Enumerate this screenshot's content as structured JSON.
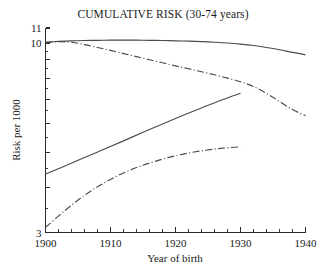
{
  "chart_data": {
    "type": "line",
    "title": "CUMULATIVE RISK (30-74 years)",
    "xlabel": "Year of birth",
    "ylabel": "Risk per 1000",
    "xlim": [
      1900,
      1940
    ],
    "ylim": [
      3,
      11
    ],
    "yscale": "log",
    "grid": false,
    "legend": "none",
    "xticks": [
      1900,
      1910,
      1920,
      1930,
      1940
    ],
    "xtick_labels": [
      "1900",
      "1910",
      "1920",
      "1930",
      "1940"
    ],
    "xminor_tick_step": 2,
    "yticks": [
      3,
      4,
      5,
      6,
      7,
      8,
      9,
      10,
      11
    ],
    "ytick_labels": [
      "3",
      "",
      "",
      "",
      "",
      "",
      "",
      "10",
      "11"
    ],
    "series": [
      {
        "name": "upper-solid",
        "style": "solid",
        "x": [
          1900,
          1902,
          1904,
          1906,
          1908,
          1910,
          1912,
          1914,
          1916,
          1918,
          1920,
          1922,
          1924,
          1926,
          1928,
          1930,
          1932,
          1934,
          1936,
          1938,
          1940
        ],
        "values": [
          10.05,
          10.1,
          10.14,
          10.16,
          10.17,
          10.18,
          10.18,
          10.18,
          10.17,
          10.16,
          10.14,
          10.12,
          10.09,
          10.05,
          10.0,
          9.93,
          9.84,
          9.72,
          9.58,
          9.42,
          9.28
        ]
      },
      {
        "name": "upper-dashdot",
        "style": "dash-dot",
        "x": [
          1900,
          1902,
          1904,
          1906,
          1908,
          1910,
          1912,
          1914,
          1916,
          1918,
          1920,
          1922,
          1924,
          1926,
          1928,
          1930,
          1932,
          1934,
          1936,
          1938,
          1940
        ],
        "values": [
          10.05,
          10.08,
          10.05,
          9.9,
          9.72,
          9.54,
          9.35,
          9.17,
          8.99,
          8.82,
          8.65,
          8.49,
          8.33,
          8.17,
          8.0,
          7.82,
          7.58,
          7.26,
          6.9,
          6.55,
          6.3
        ]
      },
      {
        "name": "lower-solid",
        "style": "solid",
        "x": [
          1900,
          1903,
          1906,
          1909,
          1912,
          1915,
          1918,
          1921,
          1924,
          1927,
          1930
        ],
        "values": [
          4.35,
          4.58,
          4.83,
          5.09,
          5.37,
          5.67,
          5.98,
          6.3,
          6.62,
          6.95,
          7.27
        ]
      },
      {
        "name": "lower-dashdot",
        "style": "dash-dot",
        "x": [
          1900,
          1903,
          1906,
          1909,
          1912,
          1915,
          1918,
          1921,
          1924,
          1927,
          1930
        ],
        "values": [
          3.1,
          3.45,
          3.8,
          4.11,
          4.38,
          4.6,
          4.78,
          4.93,
          5.04,
          5.12,
          5.17
        ]
      }
    ]
  },
  "axes": {
    "y_label": "Risk per 1000",
    "x_label": "Year of birth",
    "y_top_label": "11",
    "y_second_label": "10",
    "y_bottom_label": "3",
    "x_labels": [
      "1900",
      "1910",
      "1920",
      "1930",
      "1940"
    ]
  },
  "colors": {
    "background": "#ffffff",
    "axis": "#2b2b2b",
    "series": "#4a4a52",
    "text": "#1a1a1a"
  }
}
